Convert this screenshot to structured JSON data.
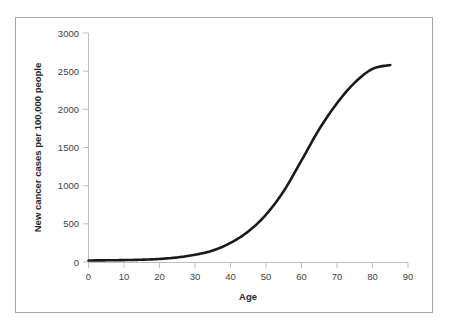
{
  "figure": {
    "background_color": "#ffffff",
    "border_color": "#a6a6a6",
    "axis_color": "#bfbfbf",
    "series_color": "#1a1a1a",
    "tick_label_color": "#3f3f3f",
    "axis_title_color": "#262626"
  },
  "chart_data": {
    "type": "line",
    "title": "",
    "subtitle": "",
    "xlabel": "Age",
    "ylabel": "New cancer cases per 100,000 people",
    "xlim": [
      0,
      90
    ],
    "ylim": [
      0,
      3000
    ],
    "xticks": [
      0,
      10,
      20,
      30,
      40,
      50,
      60,
      70,
      80,
      90
    ],
    "xtick_labels": [
      "0",
      "10",
      "20",
      "30",
      "40",
      "50",
      "60",
      "70",
      "80",
      "90"
    ],
    "yticks": [
      0,
      500,
      1000,
      1500,
      2000,
      2500,
      3000
    ],
    "ytick_labels": [
      "0",
      "500",
      "1000",
      "1500",
      "2000",
      "2500",
      "3000"
    ],
    "grid": false,
    "legend": null,
    "legend_position": "none",
    "annotations": [],
    "series": [
      {
        "name": "New cancer cases per 100,000 people",
        "color": "#1a1a1a",
        "line_width": 2.6,
        "markers": false,
        "x": [
          0,
          5,
          10,
          15,
          20,
          25,
          30,
          35,
          40,
          45,
          50,
          55,
          60,
          65,
          70,
          75,
          80,
          85
        ],
        "values": [
          20,
          22,
          25,
          30,
          40,
          60,
          95,
          150,
          250,
          400,
          620,
          930,
          1330,
          1740,
          2080,
          2350,
          2530,
          2580
        ]
      }
    ]
  }
}
